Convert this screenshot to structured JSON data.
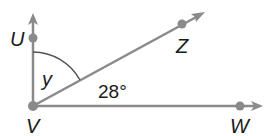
{
  "diagram": {
    "type": "angle-figure",
    "vertex": "V",
    "rays": [
      {
        "from": "V",
        "through": "U",
        "direction": "up"
      },
      {
        "from": "V",
        "through": "Z",
        "direction": "up-right"
      },
      {
        "from": "V",
        "through": "W",
        "direction": "right"
      }
    ],
    "points": {
      "U": {
        "label": "U"
      },
      "V": {
        "label": "V"
      },
      "Z": {
        "label": "Z"
      },
      "W": {
        "label": "W"
      }
    },
    "angles": [
      {
        "name": "UVZ",
        "label": "y"
      },
      {
        "name": "ZVW",
        "label": "28°"
      }
    ],
    "colors": {
      "line": "#8a8a8a",
      "point": "#8a8a8a",
      "text": "#1a1a1a"
    }
  }
}
